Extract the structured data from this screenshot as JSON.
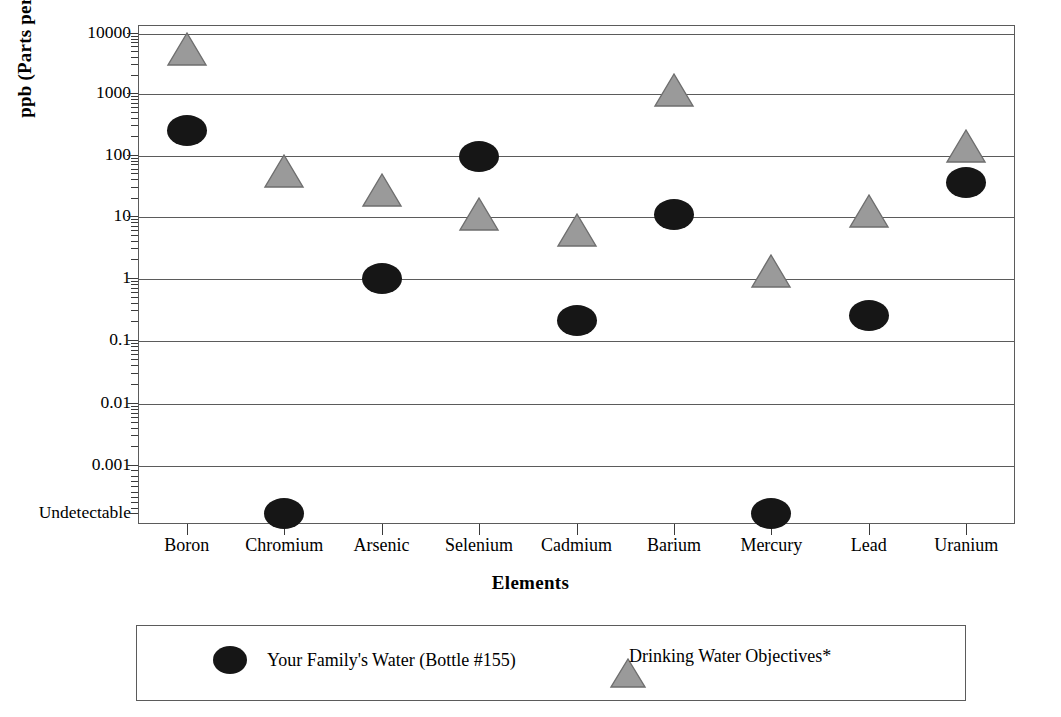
{
  "chart_data": {
    "type": "scatter",
    "title": "",
    "xlabel": "Elements",
    "ylabel": "ppb (Parts per Billion)",
    "scale": "log",
    "grid": true,
    "legend_position": "bottom",
    "categories": [
      "Boron",
      "Chromium",
      "Arsenic",
      "Selenium",
      "Cadmium",
      "Barium",
      "Mercury",
      "Lead",
      "Uranium"
    ],
    "y_tick_labels": [
      "10000",
      "1000",
      "100",
      "10",
      "1",
      "0.1",
      "0.01",
      "0.001",
      "Undetectable"
    ],
    "y_tick_values": [
      10000,
      1000,
      100,
      10,
      1,
      0.1,
      0.01,
      0.001,
      0
    ],
    "ylim": [
      0,
      10000
    ],
    "series": [
      {
        "name": "Your Family's Water (Bottle #155)",
        "marker": "ellipse",
        "color": "#161616",
        "values": [
          250,
          0,
          1.0,
          95,
          0.21,
          10.5,
          0,
          0.25,
          36
        ],
        "value_labels": [
          "250",
          "Undetectable",
          "1",
          "95",
          "0.21",
          "10.5",
          "Undetectable",
          "0.25",
          "36"
        ]
      },
      {
        "name": "Drinking Water Objectives*",
        "marker": "triangle",
        "color": "#9a9a9a",
        "values": [
          5000,
          50,
          25,
          10,
          5.5,
          1050,
          1.2,
          11,
          130
        ],
        "value_labels": [
          "5000",
          "50",
          "25",
          "10",
          "5.5",
          "1050",
          "1.2",
          "11",
          "130"
        ]
      }
    ]
  },
  "axis": {
    "y_title": "ppb (Parts per Billion)",
    "x_title": "Elements"
  },
  "legend": {
    "entries": [
      {
        "label": "Your Family's Water (Bottle #155)",
        "marker": "ellipse"
      },
      {
        "label": "Drinking Water Objectives*",
        "marker": "triangle"
      }
    ]
  },
  "colors": {
    "series_1": "#161616",
    "series_2": "#9a9a9a",
    "axis": "#5b5b5b",
    "background": "#ffffff"
  }
}
